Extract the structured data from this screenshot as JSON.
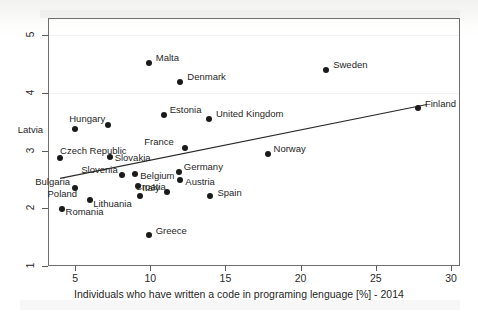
{
  "chart_data": {
    "type": "scatter",
    "title": "",
    "xlabel": "Individuals who have written a code in programing lenguage [%] - 2014",
    "ylabel": "",
    "xlim": [
      3.2,
      30.6
    ],
    "ylim": [
      1.0,
      5.3
    ],
    "xticks": [
      5,
      10,
      15,
      20,
      25,
      30
    ],
    "yticks": [
      1,
      2,
      3,
      4,
      5
    ],
    "grid": false,
    "legend": "none",
    "points": [
      {
        "label": "Malta",
        "x": 9.9,
        "y": 4.52,
        "label_dx": 7,
        "label_dy": -10
      },
      {
        "label": "Denmark",
        "x": 12.0,
        "y": 4.19,
        "label_dx": 7,
        "label_dy": -10
      },
      {
        "label": "Sweden",
        "x": 21.7,
        "y": 4.4,
        "label_dx": 7,
        "label_dy": -10
      },
      {
        "label": "Finland",
        "x": 27.8,
        "y": 3.74,
        "label_dx": 7,
        "label_dy": -9
      },
      {
        "label": "Estonia",
        "x": 10.9,
        "y": 3.62,
        "label_dx": 6,
        "label_dy": -10
      },
      {
        "label": "United Kingdom",
        "x": 13.9,
        "y": 3.55,
        "label_dx": 7,
        "label_dy": -10
      },
      {
        "label": "Hungary",
        "x": 7.2,
        "y": 3.44,
        "label_dx": -3,
        "label_dy": -11
      },
      {
        "label": "Latvia",
        "x": 5.0,
        "y": 3.37,
        "label_dx": -32,
        "label_dy": -4
      },
      {
        "label": "Czech Republic",
        "x": 4.0,
        "y": 2.88,
        "label_dx": 0,
        "label_dy": -12
      },
      {
        "label": "Slovakia",
        "x": 7.3,
        "y": 2.89,
        "label_dx": 5,
        "label_dy": -4
      },
      {
        "label": "France",
        "x": 12.3,
        "y": 3.05,
        "label_dx": -11,
        "label_dy": -11
      },
      {
        "label": "Slovenia",
        "x": 8.1,
        "y": 2.57,
        "label_dx": -4,
        "label_dy": -10
      },
      {
        "label": "Belgium",
        "x": 9.0,
        "y": 2.6,
        "label_dx": 5,
        "label_dy": -3
      },
      {
        "label": "Germany",
        "x": 11.9,
        "y": 2.63,
        "label_dx": 5,
        "label_dy": -10
      },
      {
        "label": "Austria",
        "x": 12.0,
        "y": 2.49,
        "label_dx": 5,
        "label_dy": -3
      },
      {
        "label": "Italy",
        "x": 9.2,
        "y": 2.38,
        "label_dx": 4,
        "label_dy": -3
      },
      {
        "label": "Croatia",
        "x": 11.1,
        "y": 2.28,
        "label_dx": -1,
        "label_dy": -10
      },
      {
        "label": "Lithuania",
        "x": 9.3,
        "y": 2.22,
        "label_dx": -8,
        "label_dy": 3
      },
      {
        "label": "Bulgaria",
        "x": 5.0,
        "y": 2.35,
        "label_dx": -5,
        "label_dy": -11
      },
      {
        "label": "Poland",
        "x": 6.0,
        "y": 2.15,
        "label_dx": -13,
        "label_dy": -11
      },
      {
        "label": "Romania",
        "x": 4.1,
        "y": 1.99,
        "label_dx": 4,
        "label_dy": -2
      },
      {
        "label": "Spain",
        "x": 14.0,
        "y": 2.22,
        "label_dx": 7,
        "label_dy": -8
      },
      {
        "label": "Norway",
        "x": 17.8,
        "y": 2.95,
        "label_dx": 6,
        "label_dy": -10
      },
      {
        "label": "Greece",
        "x": 9.9,
        "y": 1.53,
        "label_dx": 7,
        "label_dy": -9
      }
    ],
    "fit_line": {
      "type": "linear-fit",
      "x_start": 4.0,
      "y_start": 2.52,
      "x_end": 28.4,
      "y_end": 3.8
    }
  },
  "style": {
    "point_color": "#1a1a1a",
    "line_color": "#2a2a2a",
    "axis_color": "#5a5a5a",
    "text_color": "#1f1f1f",
    "background": "#ffffff"
  }
}
